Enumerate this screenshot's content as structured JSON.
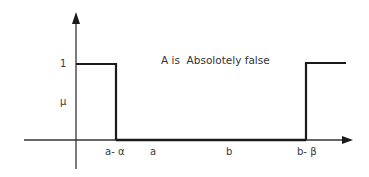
{
  "diagram": {
    "title": "A is  Absolotely false",
    "y_axis": {
      "tick_label": "1",
      "axis_label": "μ"
    },
    "x_axis": {
      "tick_labels": [
        {
          "id": "a-minus-alpha",
          "text": "a- α"
        },
        {
          "id": "a",
          "text": "a"
        },
        {
          "id": "b",
          "text": "b"
        },
        {
          "id": "b-minus-beta",
          "text": "b- β"
        }
      ]
    },
    "membership_function": {
      "description": "Membership is 1 for x < a-α, 0 between a-α and b-β, and 1 for x > b-β",
      "segments": [
        {
          "from": "origin",
          "to": "a- α",
          "value": 1
        },
        {
          "from": "a- α",
          "to": "b- β",
          "value": 0
        },
        {
          "from": "b- β",
          "to": "end",
          "value": 1
        }
      ]
    },
    "colors": {
      "line": "#1a1a1a",
      "axis": "#333333",
      "text": "#3a3a3a"
    }
  }
}
